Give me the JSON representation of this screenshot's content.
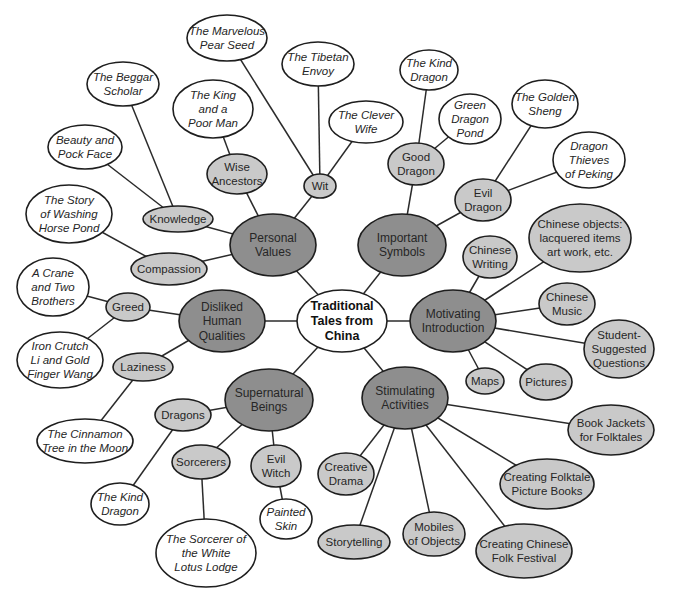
{
  "diagram": {
    "type": "concept-web",
    "colors": {
      "root_fill": "#ffffff",
      "main_fill": "#8e8e8e",
      "sub_fill": "#c9c9c9",
      "leaf_fill": "#ffffff",
      "stroke": "#1e1e1e"
    },
    "nodes": [
      {
        "id": "root",
        "level": "root",
        "lines": [
          "Traditional",
          "Tales from",
          "China"
        ],
        "cx": 342,
        "cy": 321,
        "rx": 45,
        "ry": 31
      },
      {
        "id": "personal-values",
        "level": "main",
        "lines": [
          "Personal",
          "Values"
        ],
        "cx": 273,
        "cy": 245,
        "rx": 43,
        "ry": 31
      },
      {
        "id": "important-symbols",
        "level": "main",
        "lines": [
          "Important",
          "Symbols"
        ],
        "cx": 402,
        "cy": 245,
        "rx": 44,
        "ry": 31
      },
      {
        "id": "disliked-human-qualities",
        "level": "main",
        "lines": [
          "Disliked",
          "Human",
          "Qualities"
        ],
        "cx": 222,
        "cy": 321,
        "rx": 43,
        "ry": 31
      },
      {
        "id": "motivating-introduction",
        "level": "main",
        "lines": [
          "Motivating",
          "Introduction"
        ],
        "cx": 453,
        "cy": 321,
        "rx": 43,
        "ry": 31
      },
      {
        "id": "supernatural-beings",
        "level": "main",
        "lines": [
          "Supernatural",
          "Beings"
        ],
        "cx": 269,
        "cy": 400,
        "rx": 44,
        "ry": 31
      },
      {
        "id": "stimulating-activities",
        "level": "main",
        "lines": [
          "Stimulating",
          "Activities"
        ],
        "cx": 405,
        "cy": 398,
        "rx": 43,
        "ry": 31
      },
      {
        "id": "wise-ancestors",
        "level": "sub",
        "lines": [
          "Wise",
          "Ancestors"
        ],
        "cx": 237,
        "cy": 174,
        "rx": 30,
        "ry": 20
      },
      {
        "id": "wit",
        "level": "sub",
        "lines": [
          "Wit"
        ],
        "cx": 320,
        "cy": 186,
        "rx": 16,
        "ry": 12
      },
      {
        "id": "knowledge",
        "level": "sub",
        "lines": [
          "Knowledge"
        ],
        "cx": 178,
        "cy": 219,
        "rx": 35,
        "ry": 13
      },
      {
        "id": "compassion",
        "level": "sub",
        "lines": [
          "Compassion"
        ],
        "cx": 169,
        "cy": 269,
        "rx": 38,
        "ry": 16
      },
      {
        "id": "good-dragon",
        "level": "sub",
        "lines": [
          "Good",
          "Dragon"
        ],
        "cx": 416,
        "cy": 164,
        "rx": 28,
        "ry": 21
      },
      {
        "id": "evil-dragon",
        "level": "sub",
        "lines": [
          "Evil",
          "Dragon"
        ],
        "cx": 483,
        "cy": 200,
        "rx": 28,
        "ry": 21
      },
      {
        "id": "greed",
        "level": "sub",
        "lines": [
          "Greed"
        ],
        "cx": 128,
        "cy": 307,
        "rx": 22,
        "ry": 14
      },
      {
        "id": "laziness",
        "level": "sub",
        "lines": [
          "Laziness"
        ],
        "cx": 143,
        "cy": 367,
        "rx": 30,
        "ry": 14
      },
      {
        "id": "chinese-writing",
        "level": "sub",
        "lines": [
          "Chinese",
          "Writing"
        ],
        "cx": 490,
        "cy": 257,
        "rx": 27,
        "ry": 21
      },
      {
        "id": "chinese-objects",
        "level": "sub",
        "lines": [
          "Chinese objects:",
          "lacquered items",
          "art work, etc."
        ],
        "cx": 580,
        "cy": 238,
        "rx": 51,
        "ry": 34
      },
      {
        "id": "chinese-music",
        "level": "sub",
        "lines": [
          "Chinese",
          "Music"
        ],
        "cx": 567,
        "cy": 304,
        "rx": 28,
        "ry": 21
      },
      {
        "id": "student-suggested-questions",
        "level": "sub",
        "lines": [
          "Student-",
          "Suggested",
          "Questions"
        ],
        "cx": 619,
        "cy": 349,
        "rx": 35,
        "ry": 29
      },
      {
        "id": "maps",
        "level": "sub",
        "lines": [
          "Maps"
        ],
        "cx": 485,
        "cy": 381,
        "rx": 19,
        "ry": 13
      },
      {
        "id": "pictures",
        "level": "sub",
        "lines": [
          "Pictures"
        ],
        "cx": 546,
        "cy": 382,
        "rx": 26,
        "ry": 18
      },
      {
        "id": "dragons",
        "level": "sub",
        "lines": [
          "Dragons"
        ],
        "cx": 183,
        "cy": 415,
        "rx": 28,
        "ry": 16
      },
      {
        "id": "sorcerers",
        "level": "sub",
        "lines": [
          "Sorcerers"
        ],
        "cx": 201,
        "cy": 462,
        "rx": 29,
        "ry": 17
      },
      {
        "id": "evil-witch",
        "level": "sub",
        "lines": [
          "Evil",
          "Witch"
        ],
        "cx": 276,
        "cy": 466,
        "rx": 25,
        "ry": 21
      },
      {
        "id": "creative-drama",
        "level": "sub",
        "lines": [
          "Creative",
          "Drama"
        ],
        "cx": 346,
        "cy": 474,
        "rx": 28,
        "ry": 21
      },
      {
        "id": "storytelling",
        "level": "sub",
        "lines": [
          "Storytelling"
        ],
        "cx": 354,
        "cy": 542,
        "rx": 36,
        "ry": 17
      },
      {
        "id": "mobiles-of-objects",
        "level": "sub",
        "lines": [
          "Mobiles",
          "of Objects"
        ],
        "cx": 434,
        "cy": 534,
        "rx": 31,
        "ry": 22
      },
      {
        "id": "creating-chinese-folk-festival",
        "level": "sub",
        "lines": [
          "Creating Chinese",
          "Folk Festival"
        ],
        "cx": 524,
        "cy": 551,
        "rx": 48,
        "ry": 27
      },
      {
        "id": "creating-folktale-picture-books",
        "level": "sub",
        "lines": [
          "Creating Folktale",
          "Picture Books"
        ],
        "cx": 547,
        "cy": 484,
        "rx": 47,
        "ry": 25
      },
      {
        "id": "book-jackets-for-folktales",
        "level": "sub",
        "lines": [
          "Book Jackets",
          "for Folktales"
        ],
        "cx": 611,
        "cy": 430,
        "rx": 43,
        "ry": 25
      },
      {
        "id": "the-marvelous-pear-seed",
        "level": "leaf",
        "lines": [
          "The Marvelous",
          "Pear Seed"
        ],
        "cx": 227,
        "cy": 38,
        "rx": 40,
        "ry": 23
      },
      {
        "id": "the-tibetan-envoy",
        "level": "leaf",
        "lines": [
          "The Tibetan",
          "Envoy"
        ],
        "cx": 318,
        "cy": 64,
        "rx": 36,
        "ry": 22
      },
      {
        "id": "the-clever-wife",
        "level": "leaf",
        "lines": [
          "The Clever",
          "Wife"
        ],
        "cx": 366,
        "cy": 122,
        "rx": 37,
        "ry": 21
      },
      {
        "id": "the-beggar-scholar",
        "level": "leaf",
        "lines": [
          "The Beggar",
          "Scholar"
        ],
        "cx": 123,
        "cy": 84,
        "rx": 36,
        "ry": 22
      },
      {
        "id": "the-king-and-a-poor-man",
        "level": "leaf",
        "lines": [
          "The King",
          "and a",
          "Poor Man"
        ],
        "cx": 213,
        "cy": 109,
        "rx": 40,
        "ry": 29
      },
      {
        "id": "beauty-and-pock-face",
        "level": "leaf",
        "lines": [
          "Beauty and",
          "Pock Face"
        ],
        "cx": 85,
        "cy": 147,
        "rx": 37,
        "ry": 22
      },
      {
        "id": "the-story-of-washing-horse-pond",
        "level": "leaf",
        "lines": [
          "The Story",
          "of Washing",
          "Horse Pond"
        ],
        "cx": 69,
        "cy": 214,
        "rx": 43,
        "ry": 29
      },
      {
        "id": "the-kind-dragon-top",
        "level": "leaf",
        "lines": [
          "The Kind",
          "Dragon"
        ],
        "cx": 429,
        "cy": 70,
        "rx": 29,
        "ry": 20
      },
      {
        "id": "green-dragon-pond",
        "level": "leaf",
        "lines": [
          "Green",
          "Dragon",
          "Pond"
        ],
        "cx": 470,
        "cy": 119,
        "rx": 31,
        "ry": 25
      },
      {
        "id": "the-golden-sheng",
        "level": "leaf",
        "lines": [
          "The Golden",
          "Sheng"
        ],
        "cx": 545,
        "cy": 104,
        "rx": 33,
        "ry": 24
      },
      {
        "id": "dragon-thieves-of-peking",
        "level": "leaf",
        "lines": [
          "Dragon",
          "Thieves",
          "of Peking"
        ],
        "cx": 589,
        "cy": 160,
        "rx": 36,
        "ry": 28
      },
      {
        "id": "a-crane-and-two-brothers",
        "level": "leaf",
        "lines": [
          "A Crane",
          "and Two",
          "Brothers"
        ],
        "cx": 53,
        "cy": 287,
        "rx": 36,
        "ry": 29
      },
      {
        "id": "iron-crutch-li",
        "level": "leaf",
        "lines": [
          "Iron Crutch",
          "Li and Gold",
          "Finger Wang"
        ],
        "cx": 60,
        "cy": 360,
        "rx": 43,
        "ry": 28
      },
      {
        "id": "the-cinnamon-tree-in-the-moon",
        "level": "leaf",
        "lines": [
          "The Cinnamon",
          "Tree in the Moon"
        ],
        "cx": 85,
        "cy": 441,
        "rx": 48,
        "ry": 22
      },
      {
        "id": "the-kind-dragon-bottom",
        "level": "leaf",
        "lines": [
          "The Kind",
          "Dragon"
        ],
        "cx": 120,
        "cy": 504,
        "rx": 29,
        "ry": 21
      },
      {
        "id": "the-sorcerer-of-the-white-lotus-lodge",
        "level": "leaf",
        "lines": [
          "The Sorcerer of",
          "the White",
          "Lotus Lodge"
        ],
        "cx": 206,
        "cy": 553,
        "rx": 50,
        "ry": 34
      },
      {
        "id": "painted-skin",
        "level": "leaf",
        "lines": [
          "Painted",
          "Skin"
        ],
        "cx": 286,
        "cy": 519,
        "rx": 26,
        "ry": 20
      }
    ],
    "edges": [
      [
        "root",
        "personal-values"
      ],
      [
        "root",
        "important-symbols"
      ],
      [
        "root",
        "disliked-human-qualities"
      ],
      [
        "root",
        "motivating-introduction"
      ],
      [
        "root",
        "supernatural-beings"
      ],
      [
        "root",
        "stimulating-activities"
      ],
      [
        "personal-values",
        "wise-ancestors"
      ],
      [
        "personal-values",
        "wit"
      ],
      [
        "personal-values",
        "knowledge"
      ],
      [
        "personal-values",
        "compassion"
      ],
      [
        "wise-ancestors",
        "the-king-and-a-poor-man"
      ],
      [
        "wit",
        "the-marvelous-pear-seed"
      ],
      [
        "wit",
        "the-tibetan-envoy"
      ],
      [
        "wit",
        "the-clever-wife"
      ],
      [
        "knowledge",
        "the-beggar-scholar"
      ],
      [
        "knowledge",
        "beauty-and-pock-face"
      ],
      [
        "compassion",
        "the-story-of-washing-horse-pond"
      ],
      [
        "important-symbols",
        "good-dragon"
      ],
      [
        "important-symbols",
        "evil-dragon"
      ],
      [
        "good-dragon",
        "the-kind-dragon-top"
      ],
      [
        "good-dragon",
        "green-dragon-pond"
      ],
      [
        "evil-dragon",
        "the-golden-sheng"
      ],
      [
        "evil-dragon",
        "dragon-thieves-of-peking"
      ],
      [
        "disliked-human-qualities",
        "greed"
      ],
      [
        "disliked-human-qualities",
        "laziness"
      ],
      [
        "greed",
        "a-crane-and-two-brothers"
      ],
      [
        "greed",
        "iron-crutch-li"
      ],
      [
        "laziness",
        "the-cinnamon-tree-in-the-moon"
      ],
      [
        "motivating-introduction",
        "chinese-writing"
      ],
      [
        "motivating-introduction",
        "chinese-objects"
      ],
      [
        "motivating-introduction",
        "chinese-music"
      ],
      [
        "motivating-introduction",
        "student-suggested-questions"
      ],
      [
        "motivating-introduction",
        "maps"
      ],
      [
        "motivating-introduction",
        "pictures"
      ],
      [
        "supernatural-beings",
        "dragons"
      ],
      [
        "supernatural-beings",
        "sorcerers"
      ],
      [
        "supernatural-beings",
        "evil-witch"
      ],
      [
        "dragons",
        "the-kind-dragon-bottom"
      ],
      [
        "sorcerers",
        "the-sorcerer-of-the-white-lotus-lodge"
      ],
      [
        "evil-witch",
        "painted-skin"
      ],
      [
        "stimulating-activities",
        "creative-drama"
      ],
      [
        "stimulating-activities",
        "storytelling"
      ],
      [
        "stimulating-activities",
        "mobiles-of-objects"
      ],
      [
        "stimulating-activities",
        "creating-chinese-folk-festival"
      ],
      [
        "stimulating-activities",
        "creating-folktale-picture-books"
      ],
      [
        "stimulating-activities",
        "book-jackets-for-folktales"
      ]
    ]
  }
}
